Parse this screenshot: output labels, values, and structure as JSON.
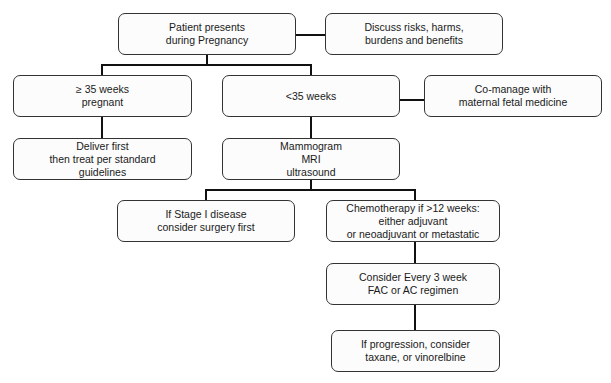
{
  "nodes": {
    "start": {
      "lines": [
        "Patient presents",
        "during Pregnancy"
      ]
    },
    "discuss": {
      "lines": [
        "Discuss risks, harms,",
        "burdens and benefits"
      ]
    },
    "ge35": {
      "lines": [
        "≥ 35 weeks",
        "pregnant"
      ]
    },
    "lt35": {
      "lines": [
        "<35 weeks"
      ]
    },
    "comanage": {
      "lines": [
        "Co-manage with",
        "maternal fetal medicine"
      ]
    },
    "deliver": {
      "lines": [
        "Deliver first",
        "then treat per standard",
        "guidelines"
      ]
    },
    "imaging": {
      "lines": [
        "Mammogram",
        "MRI",
        "ultrasound"
      ]
    },
    "stage1": {
      "lines": [
        "If Stage I disease",
        "consider surgery first"
      ]
    },
    "chemo": {
      "lines": [
        "Chemotherapy if >12 weeks:",
        "either adjuvant",
        "or neoadjuvant or metastatic"
      ]
    },
    "regimen": {
      "lines": [
        "Consider Every 3 week",
        "FAC or AC regimen"
      ]
    },
    "progression": {
      "lines": [
        "If progression, consider",
        "taxane, or vinorelbine"
      ]
    }
  }
}
